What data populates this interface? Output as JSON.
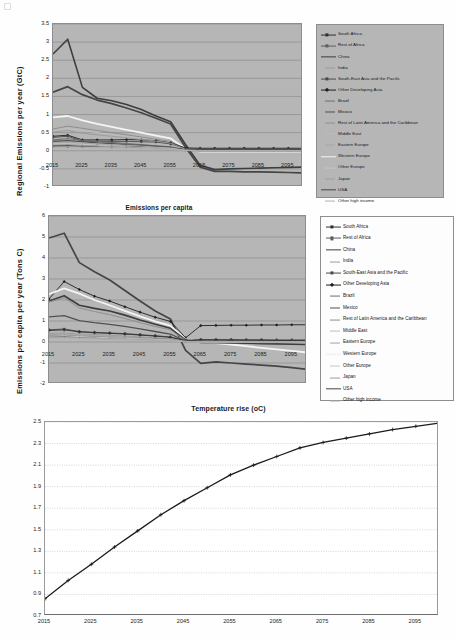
{
  "figure": {
    "background": "#fefefe",
    "plot_background_gray": "#b6b6b6",
    "plot_background_white": "#ffffff",
    "gridline_color": "#8a8a8a"
  },
  "series_names": [
    "South Africa",
    "Rest of Africa",
    "China",
    "India",
    "South-East Asia and the Pacific",
    "Other Developing Asia",
    "Brazil",
    "Mexico",
    "Rest of Latin America and the Caribbean",
    "Middle East",
    "Eastern Europe",
    "Western Europe",
    "Other Europe",
    "Japan",
    "USA",
    "Other high income"
  ],
  "series_styles": [
    {
      "name": "South Africa",
      "color": "#2f2f2f",
      "marker": "plus",
      "width": 0.9
    },
    {
      "name": "Rest of Africa",
      "color": "#5c5c5c",
      "marker": "dot",
      "width": 0.9
    },
    {
      "name": "China",
      "color": "#3d3d3d",
      "marker": "none",
      "width": 1.6
    },
    {
      "name": "India",
      "color": "#9a9a9a",
      "marker": "none",
      "width": 0.9
    },
    {
      "name": "South-East Asia and the Pacific",
      "color": "#4a4a4a",
      "marker": "dot",
      "width": 0.9
    },
    {
      "name": "Other Developing Asia",
      "color": "#1f1f1f",
      "marker": "diamond",
      "width": 0.9
    },
    {
      "name": "Brazil",
      "color": "#6e6e6e",
      "marker": "none",
      "width": 1.1
    },
    {
      "name": "Mexico",
      "color": "#505050",
      "marker": "none",
      "width": 1.3
    },
    {
      "name": "Rest of Latin America and the Caribbean",
      "color": "#8f8f8f",
      "marker": "none",
      "width": 1.0
    },
    {
      "name": "Middle East",
      "color": "#bdbdbd",
      "marker": "none",
      "width": 1.0
    },
    {
      "name": "Eastern Europe",
      "color": "#a5a5a5",
      "marker": "none",
      "width": 1.0
    },
    {
      "name": "Western Europe",
      "color": "#f4f4f4",
      "marker": "none",
      "width": 1.8
    },
    {
      "name": "Other Europe",
      "color": "#c7c7c7",
      "marker": "none",
      "width": 1.0
    },
    {
      "name": "Japan",
      "color": "#9e9e9e",
      "marker": "none",
      "width": 1.0
    },
    {
      "name": "USA",
      "color": "#454545",
      "marker": "none",
      "width": 1.7
    },
    {
      "name": "Other high income",
      "color": "#b0b0b0",
      "marker": "none",
      "width": 1.0
    }
  ],
  "chart_data": [
    {
      "id": "regional-emissions",
      "type": "line",
      "title": "",
      "xlabel": "",
      "ylabel": "Regional  Emissions per  year  (GtC)",
      "xlim": [
        2015,
        2100
      ],
      "ylim": [
        -1,
        3.5
      ],
      "ytick_step": 0.5,
      "yticks": [
        "3.5",
        "3",
        "2.5",
        "2",
        "1.5",
        "1",
        "0.5",
        "0",
        "-0.5",
        "-1"
      ],
      "xticks": [
        "2015",
        "2025",
        "2035",
        "2045",
        "2055",
        "2065",
        "2075",
        "2085",
        "2095"
      ],
      "grid": true,
      "legend_position": "right",
      "x": [
        2015,
        2020,
        2025,
        2030,
        2035,
        2040,
        2045,
        2050,
        2055,
        2060,
        2065,
        2070,
        2075,
        2080,
        2085,
        2090,
        2095,
        2100
      ],
      "series": [
        {
          "name": "China",
          "values": [
            2.67,
            3.08,
            1.75,
            1.45,
            1.38,
            1.28,
            1.14,
            0.96,
            0.8,
            0.18,
            -0.4,
            -0.52,
            -0.5,
            -0.49,
            -0.48,
            -0.47,
            -0.46,
            -0.45
          ]
        },
        {
          "name": "USA",
          "values": [
            1.62,
            1.77,
            1.55,
            1.4,
            1.3,
            1.18,
            1.05,
            0.9,
            0.74,
            0.1,
            -0.45,
            -0.57,
            -0.57,
            -0.58,
            -0.58,
            -0.59,
            -0.6,
            -0.61
          ]
        },
        {
          "name": "Western Europe",
          "values": [
            0.92,
            0.96,
            0.84,
            0.74,
            0.66,
            0.58,
            0.5,
            0.42,
            0.34,
            0.06,
            -0.02,
            -0.02,
            -0.02,
            -0.02,
            -0.02,
            -0.02,
            -0.02,
            -0.02
          ]
        },
        {
          "name": "Rest of Latin America and the Caribbean",
          "values": [
            0.6,
            0.68,
            0.62,
            0.56,
            0.5,
            0.44,
            0.38,
            0.32,
            0.26,
            0.05,
            0.02,
            0.02,
            0.02,
            0.02,
            0.02,
            0.02,
            0.02,
            0.02
          ]
        },
        {
          "name": "Middle East",
          "values": [
            0.55,
            0.62,
            0.56,
            0.5,
            0.45,
            0.4,
            0.34,
            0.29,
            0.23,
            0.04,
            0.01,
            0.01,
            0.01,
            0.01,
            0.01,
            0.01,
            0.01,
            0.01
          ]
        },
        {
          "name": "Other Developing Asia",
          "values": [
            0.4,
            0.43,
            0.3,
            0.3,
            0.3,
            0.31,
            0.3,
            0.28,
            0.22,
            0.08,
            0.07,
            0.07,
            0.07,
            0.07,
            0.07,
            0.07,
            0.07,
            0.07
          ]
        },
        {
          "name": "South-East Asia and the Pacific",
          "values": [
            0.37,
            0.4,
            0.27,
            0.26,
            0.26,
            0.26,
            0.25,
            0.24,
            0.19,
            0.06,
            0.05,
            0.05,
            0.05,
            0.05,
            0.05,
            0.05,
            0.05,
            0.05
          ]
        },
        {
          "name": "South Africa",
          "values": [
            0.14,
            0.14,
            0.13,
            0.13,
            0.12,
            0.12,
            0.11,
            0.1,
            0.09,
            0.04,
            0.03,
            0.03,
            0.03,
            0.03,
            0.03,
            0.03,
            0.03,
            0.03
          ]
        },
        {
          "name": "Rest of Africa",
          "values": [
            0.12,
            0.12,
            0.12,
            0.12,
            0.11,
            0.11,
            0.1,
            0.09,
            0.08,
            0.03,
            0.02,
            0.02,
            0.02,
            0.02,
            0.02,
            0.02,
            0.02,
            0.02
          ]
        },
        {
          "name": "India",
          "values": [
            0.52,
            0.56,
            0.48,
            0.44,
            0.4,
            0.36,
            0.31,
            0.27,
            0.21,
            0.04,
            0.0,
            0.0,
            0.0,
            0.0,
            0.0,
            0.0,
            0.0,
            0.0
          ]
        },
        {
          "name": "Brazil",
          "values": [
            0.3,
            0.33,
            0.29,
            0.26,
            0.23,
            0.2,
            0.17,
            0.14,
            0.11,
            0.02,
            0.0,
            0.0,
            0.0,
            0.0,
            0.0,
            0.0,
            0.0,
            0.0
          ]
        },
        {
          "name": "Mexico",
          "values": [
            0.26,
            0.28,
            0.25,
            0.22,
            0.2,
            0.17,
            0.15,
            0.12,
            0.09,
            0.02,
            0.0,
            0.0,
            0.0,
            0.0,
            0.0,
            0.0,
            0.0,
            0.0
          ]
        },
        {
          "name": "Eastern Europe",
          "values": [
            0.22,
            0.24,
            0.21,
            0.19,
            0.17,
            0.15,
            0.13,
            0.1,
            0.08,
            0.01,
            -0.01,
            -0.01,
            -0.01,
            -0.01,
            -0.01,
            -0.01,
            -0.01,
            -0.01
          ]
        },
        {
          "name": "Other Europe",
          "values": [
            0.18,
            0.19,
            0.17,
            0.15,
            0.13,
            0.11,
            0.09,
            0.08,
            0.06,
            0.01,
            0.0,
            0.0,
            0.0,
            0.0,
            0.0,
            0.0,
            0.0,
            0.0
          ]
        },
        {
          "name": "Japan",
          "values": [
            0.16,
            0.17,
            0.15,
            0.13,
            0.11,
            0.1,
            0.08,
            0.07,
            0.05,
            0.01,
            0.0,
            0.0,
            0.0,
            0.0,
            0.0,
            0.0,
            0.0,
            0.0
          ]
        },
        {
          "name": "Other high income",
          "values": [
            0.1,
            0.11,
            0.1,
            0.09,
            0.08,
            0.07,
            0.06,
            0.05,
            0.04,
            0.01,
            0.0,
            0.0,
            0.0,
            0.0,
            0.0,
            0.0,
            0.0,
            0.0
          ]
        }
      ]
    },
    {
      "id": "emissions-per-capita",
      "type": "line",
      "title": "Emissions per capita",
      "xlabel": "",
      "ylabel": "Emissions per capita  per year  (Tons C)",
      "xlim": [
        2015,
        2100
      ],
      "ylim": [
        -2,
        6
      ],
      "ytick_step": 1,
      "yticks": [
        "6",
        "5",
        "4",
        "3",
        "2",
        "1",
        "0",
        "-1",
        "-2"
      ],
      "xticks": [
        "2015",
        "2025",
        "2035",
        "2045",
        "2055",
        "2065",
        "2075",
        "2085",
        "2095"
      ],
      "grid": true,
      "legend_position": "right",
      "x": [
        2015,
        2020,
        2025,
        2030,
        2035,
        2040,
        2045,
        2050,
        2055,
        2060,
        2065,
        2070,
        2075,
        2080,
        2085,
        2090,
        2095,
        2100
      ],
      "series": [
        {
          "name": "USA",
          "values": [
            4.95,
            5.18,
            3.78,
            3.35,
            2.95,
            2.45,
            1.95,
            1.48,
            1.1,
            -0.4,
            -1.02,
            -0.95,
            -1.0,
            -1.05,
            -1.1,
            -1.15,
            -1.22,
            -1.3
          ]
        },
        {
          "name": "Other Developing Asia",
          "values": [
            2.05,
            2.88,
            2.5,
            2.18,
            1.95,
            1.68,
            1.42,
            1.18,
            0.98,
            0.2,
            0.78,
            0.79,
            0.8,
            0.8,
            0.81,
            0.81,
            0.82,
            0.82
          ]
        },
        {
          "name": "Western Europe",
          "values": [
            2.28,
            2.55,
            2.3,
            2.0,
            1.75,
            1.48,
            1.22,
            0.98,
            0.78,
            0.12,
            0.02,
            -0.05,
            -0.12,
            -0.2,
            -0.28,
            -0.35,
            -0.42,
            -0.5
          ]
        },
        {
          "name": "China",
          "values": [
            1.95,
            2.2,
            1.75,
            1.6,
            1.48,
            1.28,
            1.05,
            0.85,
            0.65,
            0.1,
            -0.02,
            -0.03,
            -0.05,
            -0.06,
            -0.08,
            -0.09,
            -0.1,
            -0.12
          ]
        },
        {
          "name": "Rest of Latin America and the Caribbean",
          "values": [
            1.9,
            2.1,
            1.62,
            1.45,
            1.3,
            1.12,
            0.92,
            0.74,
            0.58,
            0.08,
            0.05,
            0.05,
            0.04,
            0.04,
            0.03,
            0.03,
            0.02,
            0.02
          ]
        },
        {
          "name": "Middle East",
          "values": [
            1.18,
            1.25,
            1.05,
            0.95,
            0.88,
            0.78,
            0.66,
            0.54,
            0.42,
            0.05,
            0.02,
            0.02,
            0.01,
            0.01,
            0.01,
            0.0,
            0.0,
            0.0
          ]
        },
        {
          "name": "Mexico",
          "values": [
            1.2,
            1.26,
            1.02,
            0.92,
            0.84,
            0.74,
            0.62,
            0.5,
            0.38,
            0.04,
            0.01,
            0.01,
            0.0,
            0.0,
            0.0,
            0.0,
            0.0,
            0.0
          ]
        },
        {
          "name": "South-East Asia and the Pacific",
          "values": [
            0.58,
            0.62,
            0.5,
            0.46,
            0.43,
            0.4,
            0.35,
            0.3,
            0.24,
            0.08,
            0.12,
            0.12,
            0.12,
            0.11,
            0.11,
            0.1,
            0.1,
            0.1
          ]
        },
        {
          "name": "South Africa",
          "values": [
            0.55,
            0.58,
            0.48,
            0.44,
            0.41,
            0.38,
            0.33,
            0.28,
            0.22,
            0.06,
            0.09,
            0.09,
            0.08,
            0.08,
            0.08,
            0.07,
            0.07,
            0.07
          ]
        },
        {
          "name": "Rest of Africa",
          "values": [
            0.25,
            0.26,
            0.24,
            0.23,
            0.22,
            0.21,
            0.19,
            0.17,
            0.14,
            0.04,
            0.03,
            0.03,
            0.03,
            0.03,
            0.02,
            0.02,
            0.02,
            0.02
          ]
        },
        {
          "name": "India",
          "values": [
            0.4,
            0.43,
            0.38,
            0.35,
            0.32,
            0.28,
            0.24,
            0.2,
            0.16,
            0.03,
            0.01,
            0.01,
            0.01,
            0.0,
            0.0,
            0.0,
            0.0,
            0.0
          ]
        },
        {
          "name": "Brazil",
          "values": [
            0.3,
            0.32,
            0.28,
            0.26,
            0.23,
            0.2,
            0.17,
            0.14,
            0.11,
            0.02,
            0.0,
            0.0,
            0.0,
            0.0,
            0.0,
            0.0,
            0.0,
            0.0
          ]
        },
        {
          "name": "Eastern Europe",
          "values": [
            0.35,
            0.37,
            0.32,
            0.29,
            0.26,
            0.22,
            0.19,
            0.15,
            0.12,
            0.02,
            -0.01,
            -0.01,
            -0.02,
            -0.02,
            -0.03,
            -0.03,
            -0.04,
            -0.04
          ]
        },
        {
          "name": "Other Europe",
          "values": [
            0.28,
            0.3,
            0.26,
            0.23,
            0.2,
            0.18,
            0.15,
            0.12,
            0.09,
            0.01,
            0.0,
            0.0,
            0.0,
            0.0,
            0.0,
            0.0,
            0.0,
            0.0
          ]
        },
        {
          "name": "Japan",
          "values": [
            0.22,
            0.23,
            0.2,
            0.18,
            0.16,
            0.14,
            0.12,
            0.09,
            0.07,
            0.01,
            0.0,
            0.0,
            0.0,
            0.0,
            0.0,
            0.0,
            0.0,
            0.0
          ]
        },
        {
          "name": "Other high income",
          "values": [
            0.18,
            0.19,
            0.17,
            0.15,
            0.13,
            0.11,
            0.09,
            0.08,
            0.06,
            0.01,
            0.0,
            0.0,
            0.0,
            0.0,
            0.0,
            0.0,
            0.0,
            0.0
          ]
        }
      ]
    },
    {
      "id": "temperature-rise",
      "type": "line",
      "title": "Temperature rise (oC)",
      "xlabel": "",
      "ylabel": "",
      "xlim": [
        2015,
        2100
      ],
      "ylim": [
        0.7,
        2.5
      ],
      "ytick_step": 0.2,
      "yticks": [
        "2.5",
        "2.3",
        "2.1",
        "1.9",
        "1.7",
        "1.5",
        "1.3",
        "1.1",
        "0.9",
        "0.7"
      ],
      "xticks": [
        "2015",
        "2025",
        "2035",
        "2045",
        "2055",
        "2065",
        "2075",
        "2085",
        "2095"
      ],
      "grid": true,
      "legend_position": "none",
      "marker": "plus",
      "line_color": "#1a1a1a",
      "x": [
        2015,
        2020,
        2025,
        2030,
        2035,
        2040,
        2045,
        2050,
        2055,
        2060,
        2065,
        2070,
        2075,
        2080,
        2085,
        2090,
        2095,
        2100
      ],
      "values": [
        0.86,
        1.03,
        1.18,
        1.34,
        1.49,
        1.64,
        1.77,
        1.89,
        2.01,
        2.1,
        2.18,
        2.26,
        2.31,
        2.35,
        2.39,
        2.43,
        2.46,
        2.49
      ]
    }
  ]
}
